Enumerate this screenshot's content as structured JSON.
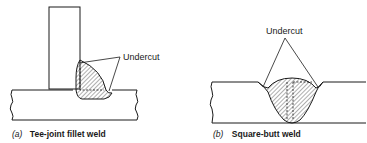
{
  "figure_a": {
    "callout": "Undercut",
    "caption_index": "(a)",
    "caption_text": "Tee-joint fillet weld"
  },
  "figure_b": {
    "callout": "Undercut",
    "caption_index": "(b)",
    "caption_text": "Square-butt weld"
  },
  "colors": {
    "line": "#1a1a1a",
    "background": "#ffffff"
  }
}
